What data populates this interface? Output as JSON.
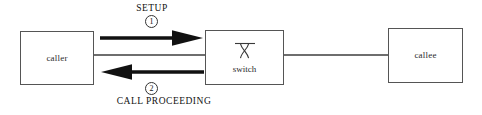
{
  "diagram": {
    "colors": {
      "box_border": "#555555",
      "link_line": "#6e6e6e",
      "arrow": "#111111",
      "text": "#2b2b2b",
      "background": "#ffffff"
    },
    "nodes": [
      {
        "id": "caller",
        "label": "caller"
      },
      {
        "id": "switch",
        "label": "switch",
        "icon": "switch-crossing-icon"
      },
      {
        "id": "callee",
        "label": "callee"
      }
    ],
    "links": [
      {
        "id": "caller-switch",
        "from": "caller",
        "to": "switch"
      },
      {
        "id": "switch-callee",
        "from": "switch",
        "to": "callee"
      }
    ],
    "messages": [
      {
        "id": "setup",
        "label": "SETUP",
        "sequence": "1",
        "direction": "right",
        "from": "caller",
        "to": "switch"
      },
      {
        "id": "call-proceeding",
        "label": "CALL PROCEEDING",
        "sequence": "2",
        "direction": "left",
        "from": "switch",
        "to": "caller"
      }
    ]
  }
}
